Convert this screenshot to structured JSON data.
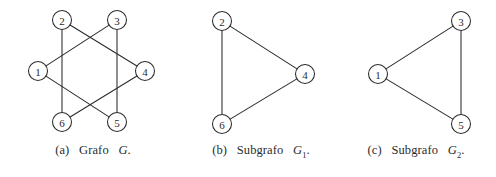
{
  "figure": {
    "background_color": "#ffffff",
    "stroke_color": "#2b2b2b",
    "node_fill_color": "#ffffff",
    "node_radius": 9.5
  },
  "subfigures": [
    {
      "id": "a",
      "caption_tag": "(a)",
      "caption_word": "Grafo",
      "caption_symbol": "G",
      "caption_subscript": "",
      "caption_period": ".",
      "caption_full": "(a) Grafo G.",
      "graph": {
        "type": "undirected",
        "name": "G",
        "nodes": [
          {
            "id": "1",
            "label": "1",
            "x": 38,
            "y": 71
          },
          {
            "id": "2",
            "label": "2",
            "x": 62,
            "y": 20
          },
          {
            "id": "3",
            "label": "3",
            "x": 117,
            "y": 20
          },
          {
            "id": "4",
            "label": "4",
            "x": 145,
            "y": 71
          },
          {
            "id": "5",
            "label": "5",
            "x": 117,
            "y": 122
          },
          {
            "id": "6",
            "label": "6",
            "x": 62,
            "y": 122
          }
        ],
        "edges": [
          {
            "from": "1",
            "to": "3"
          },
          {
            "from": "3",
            "to": "5"
          },
          {
            "from": "5",
            "to": "1"
          },
          {
            "from": "2",
            "to": "4"
          },
          {
            "from": "4",
            "to": "6"
          },
          {
            "from": "6",
            "to": "2"
          }
        ],
        "node_count": 6,
        "edge_count": 6
      }
    },
    {
      "id": "b",
      "caption_tag": "(b)",
      "caption_word": "Subgrafo",
      "caption_symbol": "G",
      "caption_subscript": "1",
      "caption_period": ".",
      "caption_full": "(b) Subgrafo G1.",
      "graph": {
        "type": "undirected",
        "name": "G1",
        "nodes": [
          {
            "id": "2",
            "label": "2",
            "x": 36,
            "y": 21
          },
          {
            "id": "4",
            "label": "4",
            "x": 119,
            "y": 74
          },
          {
            "id": "6",
            "label": "6",
            "x": 36,
            "y": 124
          }
        ],
        "edges": [
          {
            "from": "2",
            "to": "4"
          },
          {
            "from": "4",
            "to": "6"
          },
          {
            "from": "6",
            "to": "2"
          }
        ],
        "node_count": 3,
        "edge_count": 3
      }
    },
    {
      "id": "c",
      "caption_tag": "(c)",
      "caption_word": "Subgrafo",
      "caption_symbol": "G",
      "caption_subscript": "2",
      "caption_period": ".",
      "caption_full": "(c) Subgrafo G2.",
      "graph": {
        "type": "undirected",
        "name": "G2",
        "nodes": [
          {
            "id": "1",
            "label": "1",
            "x": 42,
            "y": 74
          },
          {
            "id": "3",
            "label": "3",
            "x": 125,
            "y": 21
          },
          {
            "id": "5",
            "label": "5",
            "x": 125,
            "y": 124
          }
        ],
        "edges": [
          {
            "from": "1",
            "to": "3"
          },
          {
            "from": "3",
            "to": "5"
          },
          {
            "from": "5",
            "to": "1"
          }
        ],
        "node_count": 3,
        "edge_count": 3
      }
    }
  ]
}
